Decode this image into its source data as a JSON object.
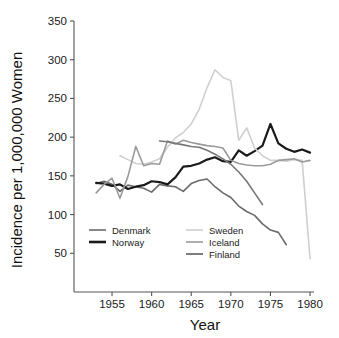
{
  "chart_data": {
    "type": "line",
    "title": "",
    "xlabel": "Year",
    "ylabel": "Incidence per 1,000,000 Women",
    "xlim": [
      1950.2,
      1980.5
    ],
    "ylim": [
      0,
      350
    ],
    "grid": false,
    "legend_position": "inside-bottom-left",
    "xticks": [
      1955,
      1960,
      1965,
      1970,
      1975,
      1980
    ],
    "xtick_labels": [
      "1955",
      "1960",
      "1965",
      "1970",
      "1975",
      "1980"
    ],
    "yticks": [
      50,
      100,
      150,
      200,
      250,
      300,
      350
    ],
    "ytick_labels": [
      "50",
      "100",
      "150",
      "200",
      "250",
      "300",
      "350"
    ],
    "series": [
      {
        "name": "Denmark",
        "color": "#6b6b6b",
        "width": 1.6,
        "x": [
          1953,
          1954,
          1955,
          1956,
          1957,
          1958,
          1959,
          1960,
          1961,
          1962,
          1963,
          1964,
          1965,
          1966,
          1967,
          1968,
          1969,
          1970,
          1971,
          1972,
          1973,
          1974,
          1975,
          1976,
          1977
        ],
        "values": [
          140,
          143,
          139,
          130,
          138,
          136,
          134,
          129,
          139,
          137,
          136,
          130,
          140,
          144,
          146,
          136,
          128,
          122,
          111,
          104,
          99,
          88,
          80,
          77,
          61
        ]
      },
      {
        "name": "Norway",
        "color": "#1a1a1a",
        "width": 2.2,
        "x": [
          1953,
          1954,
          1955,
          1956,
          1957,
          1958,
          1959,
          1960,
          1961,
          1962,
          1963,
          1964,
          1965,
          1966,
          1967,
          1968,
          1969,
          1970,
          1971,
          1972,
          1973,
          1974,
          1975,
          1976,
          1977,
          1978,
          1979,
          1980
        ],
        "values": [
          141,
          140,
          137,
          139,
          133,
          136,
          138,
          143,
          142,
          139,
          148,
          162,
          163,
          166,
          171,
          174,
          169,
          168,
          183,
          176,
          182,
          189,
          217,
          192,
          185,
          181,
          184,
          180
        ]
      },
      {
        "name": "Sweden",
        "color": "#cfcfcf",
        "width": 1.6,
        "x": [
          1956,
          1957,
          1958,
          1959,
          1960,
          1961,
          1962,
          1963,
          1964,
          1965,
          1966,
          1967,
          1968,
          1969,
          1970,
          1971,
          1972,
          1973,
          1974,
          1975,
          1976,
          1977,
          1978,
          1979,
          1980
        ],
        "values": [
          176,
          171,
          166,
          165,
          168,
          172,
          187,
          199,
          206,
          217,
          236,
          264,
          287,
          277,
          273,
          196,
          212,
          186,
          176,
          170,
          170,
          169,
          171,
          170,
          43
        ]
      },
      {
        "name": "Iceland",
        "color": "#9a9a9a",
        "width": 1.6,
        "x": [
          1953,
          1954,
          1955,
          1956,
          1957,
          1958,
          1959,
          1960,
          1961,
          1962,
          1963,
          1964,
          1965,
          1966,
          1967,
          1968,
          1969,
          1970,
          1971,
          1972,
          1973,
          1974,
          1975,
          1976,
          1977,
          1978,
          1979,
          1980
        ],
        "values": [
          128,
          139,
          147,
          121,
          149,
          188,
          163,
          166,
          165,
          195,
          191,
          196,
          193,
          191,
          189,
          188,
          186,
          170,
          166,
          164,
          163,
          163,
          165,
          170,
          171,
          172,
          168,
          170
        ]
      },
      {
        "name": "Finland",
        "color": "#777777",
        "width": 1.6,
        "x": [
          1961,
          1962,
          1963,
          1964,
          1965,
          1966,
          1967,
          1968,
          1969,
          1970,
          1971,
          1972,
          1973,
          1974
        ],
        "values": [
          195,
          194,
          192,
          190,
          188,
          187,
          183,
          178,
          172,
          165,
          155,
          143,
          128,
          113
        ]
      }
    ]
  },
  "legend": {
    "entries": [
      {
        "label": "Denmark",
        "color": "#6b6b6b",
        "width": 1.6,
        "col": 0,
        "row": 0
      },
      {
        "label": "Norway",
        "color": "#1a1a1a",
        "width": 2.6,
        "col": 0,
        "row": 1
      },
      {
        "label": "Sweden",
        "color": "#cfcfcf",
        "width": 1.6,
        "col": 1,
        "row": 0
      },
      {
        "label": "Iceland",
        "color": "#9a9a9a",
        "width": 1.6,
        "col": 1,
        "row": 1
      },
      {
        "label": "Finland",
        "color": "#777777",
        "width": 1.9,
        "col": 1,
        "row": 2
      }
    ]
  },
  "axes": {
    "x_title": "Year",
    "y_title": "Incidence per 1,000,000 Women"
  }
}
